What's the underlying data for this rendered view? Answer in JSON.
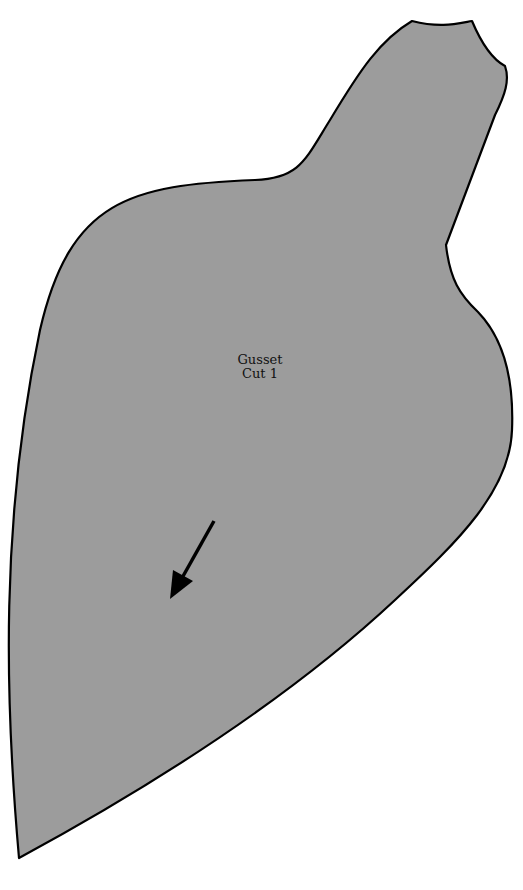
{
  "pattern_piece": {
    "name": "Gusset",
    "instruction": "Cut 1",
    "fill_color": "#9c9c9c",
    "outline_color": "#000000",
    "grainline_arrow": {
      "icon": "grainline-arrow-icon",
      "direction": "down-left"
    }
  }
}
